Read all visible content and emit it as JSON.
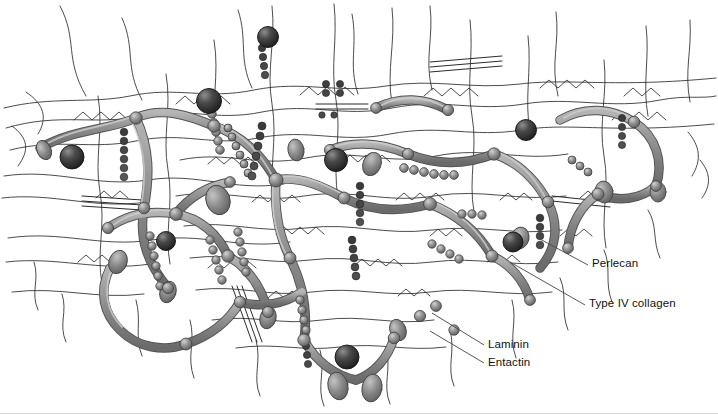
{
  "figure": {
    "background_color": "#ffffff",
    "width": 718,
    "height": 414
  },
  "labels": [
    {
      "id": "perlecan",
      "text": "Perlecan",
      "leader_from": [
        538,
        238
      ],
      "leader_to": [
        588,
        265
      ],
      "text_x": 592,
      "text_y": 258
    },
    {
      "id": "collagen",
      "text": "Type IV collagen",
      "leader_from": [
        510,
        262
      ],
      "leader_to": [
        585,
        305
      ],
      "text_x": 589,
      "text_y": 298
    },
    {
      "id": "laminin",
      "text": "Laminin",
      "leader_from": [
        432,
        313
      ],
      "leader_to": [
        484,
        345
      ],
      "text_x": 488,
      "text_y": 339
    },
    {
      "id": "entactin",
      "text": "Entactin",
      "leader_from": [
        430,
        331
      ],
      "leader_to": [
        484,
        363
      ],
      "text_x": 488,
      "text_y": 357
    }
  ],
  "legend_semantics": {
    "perlecan": "dark beaded chain of small spheres",
    "type_iv_collagen": "thin black wavy filament network",
    "laminin": "thick gray cross-shaped tube",
    "entactin": "large dark shaded sphere"
  },
  "colors": {
    "background": "#ffffff",
    "tube_fill": "#8f8f8f",
    "tube_stroke": "#4a4a4a",
    "tube_highlight": "#c9c9c9",
    "bead_fill": "#8a8a8a",
    "bead_stroke": "#3c3c3c",
    "bead_highlight": "#cfcfcf",
    "sphere_dark": "#2e2e2e",
    "sphere_dark_mid": "#545454",
    "sphere_highlight": "#9a9a9a",
    "collagen_line": "#1a1a1a",
    "leader_line": "#4d4d4d",
    "label_text": "#111111",
    "bottom_rule": "#d8d8d8"
  }
}
